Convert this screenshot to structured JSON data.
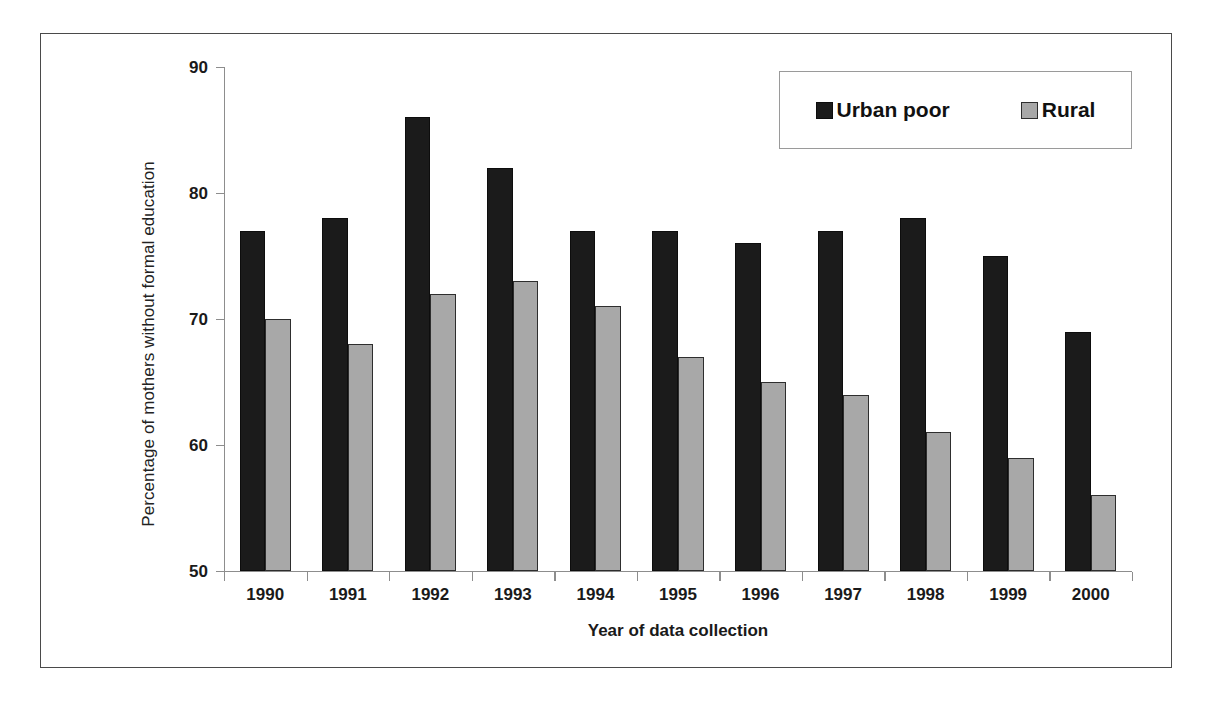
{
  "chart_data": {
    "type": "bar",
    "title": "",
    "xlabel": "Year of data collection",
    "ylabel": "Percentage of mothers without formal education",
    "categories": [
      "1990",
      "1991",
      "1992",
      "1993",
      "1994",
      "1995",
      "1996",
      "1997",
      "1998",
      "1999",
      "2000"
    ],
    "series": [
      {
        "name": "Urban poor",
        "color": "#1b1b1b",
        "values": [
          77,
          78,
          86,
          82,
          77,
          77,
          76,
          77,
          78,
          75,
          69
        ]
      },
      {
        "name": "Rural",
        "color": "#a8a8a8",
        "values": [
          70,
          68,
          72,
          73,
          71,
          67,
          65,
          64,
          61,
          59,
          56
        ]
      }
    ],
    "ylim": [
      50,
      90
    ],
    "y_ticks": [
      50,
      60,
      70,
      80,
      90
    ],
    "y_tick_labels": [
      "50",
      "60",
      "70",
      "80",
      "90"
    ],
    "grid": false,
    "legend_position": "top-right",
    "frame": true
  },
  "legend": {
    "entries": [
      {
        "label": "Urban poor",
        "swatch": "urban-poor-swatch"
      },
      {
        "label": "Rural",
        "swatch": "rural-swatch"
      }
    ]
  },
  "axes": {
    "x_title": "Year of data collection",
    "y_title": "Percentage of mothers without formal education"
  },
  "colors": {
    "urban_poor": "#1b1b1b",
    "rural": "#a8a8a8",
    "axis": "#8d8d8d",
    "frame": "#4a4a4a",
    "background": "#ffffff",
    "text": "#1a1a1a"
  }
}
